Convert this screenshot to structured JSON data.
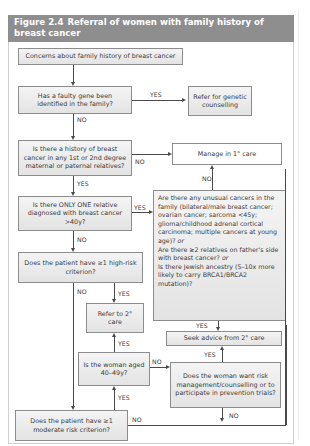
{
  "figure": {
    "number": "Figure 2.4",
    "title": "Referral of women with family history of breast cancer",
    "header_color": "#8e8e8e"
  },
  "boxes": {
    "concerns": "Concerns about family history of breast cancer",
    "faulty_gene": "Has a faulty gene been identified in the family?",
    "refer_genetic": "Refer for genetic counselling",
    "history": "Is there a history of breast cancer in any 1st or 2nd degree maternal or paternal relatives?",
    "manage_primary": "Manage in 1° care",
    "only_one": "Is there ONLY ONE relative diagnosed with breast cancer >40y?",
    "unusual": {
      "line1": "Are there any unusual cancers in the family (bilateral/male breast cancer; ovarian cancer; sarcoma <45y; glioma/childhood adrenal cortical carcinoma; multiple cancers at young age)?",
      "or1": "or",
      "line2": "Are there ≥2 relatives on father's side with breast cancer?",
      "or2": "or",
      "line3": "Is there Jewish ancestry (5–10x more likely to carry BRCA1/BRCA2 mutation)?"
    },
    "high_risk": "Does the patient have ≥1 high-risk criterion?",
    "refer_secondary": "Refer to 2° care",
    "seek_advice": "Seek advice from 2° care",
    "aged": "Is the woman aged 40–49y?",
    "want_risk": "Does the woman want risk management/counselling or to participate in prevention trials?",
    "moderate": "Does the patient have ≥1 moderate risk criterion?"
  },
  "labels": {
    "yes": "YES",
    "no": "NO"
  }
}
